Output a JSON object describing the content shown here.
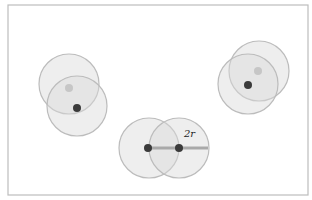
{
  "diagram": {
    "frame": {
      "x": 8,
      "y": 5,
      "width": 300,
      "height": 190,
      "stroke": "#bdbdbd"
    },
    "colors": {
      "disk_fill": "#d9d9d9",
      "disk_stroke": "#bcbcbc",
      "dark_dot": "#3a3a3a",
      "light_dot": "#c6c6c6",
      "line": "#a9a9a9"
    },
    "radius": 30,
    "groups": [
      {
        "name": "left-pair",
        "disks": [
          {
            "cx": 69,
            "cy": 84,
            "dot": "light",
            "dx": 69,
            "dy": 88
          },
          {
            "cx": 77,
            "cy": 106,
            "dot": "dark",
            "dx": 77,
            "dy": 108
          }
        ]
      },
      {
        "name": "right-pair",
        "disks": [
          {
            "cx": 259,
            "cy": 71,
            "dot": "light",
            "dx": 258,
            "dy": 71
          },
          {
            "cx": 248,
            "cy": 84,
            "dot": "dark",
            "dx": 248,
            "dy": 85
          }
        ]
      },
      {
        "name": "bottom-pair",
        "disks": [
          {
            "cx": 149,
            "cy": 148,
            "dot": "dark",
            "dx": 148,
            "dy": 148
          },
          {
            "cx": 179,
            "cy": 148,
            "dot": "dark",
            "dx": 179,
            "dy": 148
          }
        ]
      }
    ],
    "diameter_line": {
      "x1": 148,
      "y1": 148,
      "x2": 208,
      "y2": 148
    },
    "label": {
      "text": "2r",
      "x": 184,
      "y": 137
    }
  }
}
